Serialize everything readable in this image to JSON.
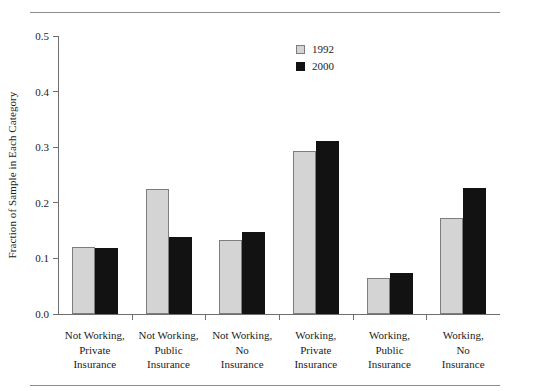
{
  "chart_data": {
    "type": "bar",
    "title": "",
    "xlabel": "",
    "ylabel": "Fraction of Sample in Each Category",
    "ylim": [
      0.0,
      0.5
    ],
    "ytick_labels": [
      "0.0",
      "0.1",
      "0.2",
      "0.3",
      "0.4",
      "0.5"
    ],
    "ytick_values": [
      0.0,
      0.1,
      0.2,
      0.3,
      0.4,
      0.5
    ],
    "grid": false,
    "legend_position": "top-center-right",
    "categories": [
      "Not Working, Private Insurance",
      "Not Working, Public Insurance",
      "Not Working, No Insurance",
      "Working, Private Insurance",
      "Working, Public Insurance",
      "Working, No Insurance"
    ],
    "category_lines": [
      [
        "Not Working,",
        "Private",
        "Insurance"
      ],
      [
        "Not Working,",
        "Public",
        "Insurance"
      ],
      [
        "Not Working,",
        "No",
        "Insurance"
      ],
      [
        "Working,",
        "Private",
        "Insurance"
      ],
      [
        "Working,",
        "Public",
        "Insurance"
      ],
      [
        "Working,",
        "No",
        "Insurance"
      ]
    ],
    "series": [
      {
        "name": "1992",
        "color": "#d4d4d4",
        "values": [
          0.12,
          0.225,
          0.134,
          0.293,
          0.065,
          0.173
        ]
      },
      {
        "name": "2000",
        "color": "#121212",
        "values": [
          0.118,
          0.139,
          0.148,
          0.311,
          0.074,
          0.226
        ]
      }
    ]
  },
  "legend": {
    "entries": [
      {
        "label": "1992"
      },
      {
        "label": "2000"
      }
    ]
  }
}
